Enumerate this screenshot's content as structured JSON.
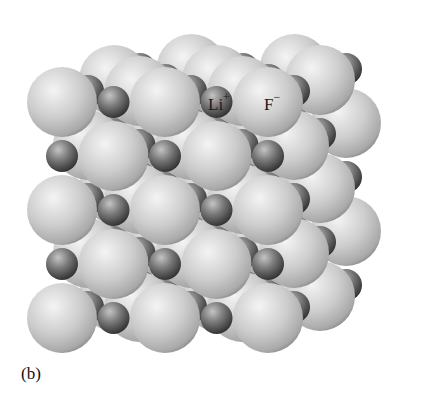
{
  "figure": {
    "caption": "(b)",
    "labels": {
      "cation": {
        "symbol": "Li",
        "charge": "+",
        "x": 208,
        "y": 93
      },
      "anion": {
        "symbol": "F",
        "charge": "−",
        "x": 264,
        "y": 93
      }
    },
    "colors": {
      "anion_light": "#f2f2f2",
      "anion_mid": "#c8c8c8",
      "anion_dark": "#8c8c8c",
      "cation_light": "#bdbdbd",
      "cation_mid": "#6e6e6e",
      "cation_dark": "#2e2e2e",
      "background": "#ffffff"
    },
    "geometry": {
      "anion_radius": 35,
      "cation_radius": 16,
      "spacing": 51.5,
      "front_origin_x": 62,
      "front_origin_y": 102,
      "depth_dx": 26,
      "depth_dy": -11,
      "rows": 5,
      "cols": 5,
      "layers": 4
    }
  }
}
